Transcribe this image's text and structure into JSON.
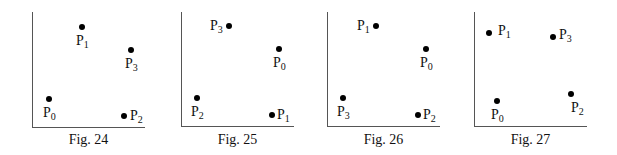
{
  "figures": [
    {
      "caption": "Fig. 24",
      "axis": {
        "x0": 32,
        "y_top": 12,
        "y_bottom": 127,
        "x_end": 145
      },
      "points": [
        {
          "name": "P",
          "sub": "0",
          "x": 49,
          "y": 99,
          "lx": 43,
          "ly": 106
        },
        {
          "name": "P",
          "sub": "1",
          "x": 82,
          "y": 27,
          "lx": 76,
          "ly": 34
        },
        {
          "name": "P",
          "sub": "2",
          "x": 124,
          "y": 116,
          "lx": 130,
          "ly": 109
        },
        {
          "name": "P",
          "sub": "3",
          "x": 131,
          "y": 50,
          "lx": 125,
          "ly": 57
        }
      ]
    },
    {
      "caption": "Fig. 25",
      "axis": {
        "x0": 181,
        "y_top": 12,
        "y_bottom": 126,
        "x_end": 294
      },
      "points": [
        {
          "name": "P",
          "sub": "0",
          "x": 279,
          "y": 49,
          "lx": 273,
          "ly": 56
        },
        {
          "name": "P",
          "sub": "1",
          "x": 272,
          "y": 115,
          "lx": 277,
          "ly": 108
        },
        {
          "name": "P",
          "sub": "2",
          "x": 197,
          "y": 98,
          "lx": 191,
          "ly": 105
        },
        {
          "name": "P",
          "sub": "3",
          "x": 229,
          "y": 26,
          "lx": 210,
          "ly": 19
        }
      ]
    },
    {
      "caption": "Fig. 26",
      "axis": {
        "x0": 327,
        "y_top": 12,
        "y_bottom": 126,
        "x_end": 440
      },
      "points": [
        {
          "name": "P",
          "sub": "0",
          "x": 426,
          "y": 49,
          "lx": 420,
          "ly": 56
        },
        {
          "name": "P",
          "sub": "1",
          "x": 376,
          "y": 26,
          "lx": 357,
          "ly": 19
        },
        {
          "name": "P",
          "sub": "2",
          "x": 418,
          "y": 115,
          "lx": 423,
          "ly": 108
        },
        {
          "name": "P",
          "sub": "3",
          "x": 343,
          "y": 98,
          "lx": 337,
          "ly": 105
        }
      ]
    },
    {
      "caption": "Fig. 27",
      "axis": {
        "x0": 474,
        "y_top": 12,
        "y_bottom": 126,
        "x_end": 587
      },
      "points": [
        {
          "name": "P",
          "sub": "0",
          "x": 497,
          "y": 101,
          "lx": 491,
          "ly": 108
        },
        {
          "name": "P",
          "sub": "1",
          "x": 489,
          "y": 33,
          "lx": 498,
          "ly": 24
        },
        {
          "name": "P",
          "sub": "2",
          "x": 571,
          "y": 94,
          "lx": 571,
          "ly": 101
        },
        {
          "name": "P",
          "sub": "3",
          "x": 553,
          "y": 37,
          "lx": 559,
          "ly": 28
        }
      ]
    }
  ]
}
